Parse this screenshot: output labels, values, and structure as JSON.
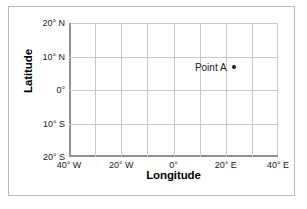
{
  "chart_data": {
    "type": "scatter",
    "title": "",
    "xlabel": "Longitude",
    "ylabel": "Latitude",
    "xlim": [
      -40,
      40
    ],
    "ylim": [
      -20,
      20
    ],
    "grid": true,
    "grid_step_x": 10,
    "grid_step_y": 10,
    "legend": "none",
    "x_tick_values": [
      -40,
      -20,
      0,
      20,
      40
    ],
    "x_tick_labels": [
      "40° W",
      "20° W",
      "0°",
      "20° E",
      "40° E"
    ],
    "y_tick_values": [
      20,
      10,
      0,
      -10,
      -20
    ],
    "y_tick_labels": [
      "20° N",
      "10° N",
      "0°",
      "10° S",
      "20° S"
    ],
    "points": [
      {
        "name": "Point A",
        "label": "Point A",
        "longitude": 23,
        "latitude": 7
      }
    ]
  },
  "colors": {
    "frame_border": "#b9bcbe",
    "gridline": "#c6c8ca",
    "axis_line": "#8e9194",
    "text": "#1a1a1a",
    "marker": "#1a1a1a",
    "background": "#ffffff"
  }
}
